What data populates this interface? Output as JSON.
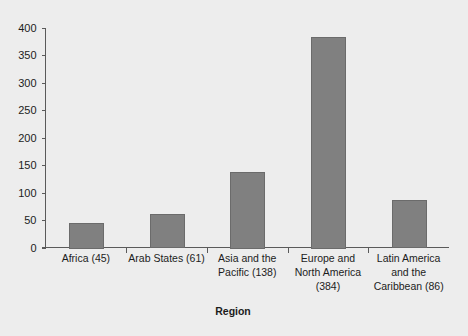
{
  "chart_data": {
    "type": "bar",
    "title": "",
    "subtitle": "",
    "xlabel": "Region",
    "ylabel": "",
    "categories": [
      "Africa (45)",
      "Arab States (61)",
      "Asia and the Pacific (138)",
      "Europe and North America (384)",
      "Latin America and the Caribbean (86)"
    ],
    "category_lines": [
      [
        "Africa (45)"
      ],
      [
        "Arab States (61)"
      ],
      [
        "Asia and the",
        "Pacific (138)"
      ],
      [
        "Europe and",
        "North America",
        "(384)"
      ],
      [
        "Latin America",
        "and the",
        "Caribbean (86)"
      ]
    ],
    "values": [
      45,
      61,
      138,
      384,
      86
    ],
    "ylim": [
      0,
      400
    ],
    "yticks": [
      0,
      50,
      100,
      150,
      200,
      250,
      300,
      350,
      400
    ],
    "ytick_labels": [
      "0",
      "50",
      "100",
      "150",
      "200",
      "250",
      "300",
      "350",
      "400"
    ],
    "grid": false,
    "legend": null,
    "legend_position": "none",
    "bar_color": "#808080",
    "bar_edge_color": "#6b6b6b",
    "background_color": "#ededed",
    "axis_color": "#5a5a5a",
    "text_color": "#1c1c1c"
  }
}
